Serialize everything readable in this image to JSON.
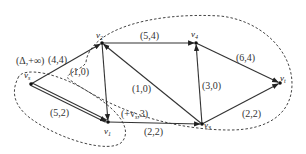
{
  "diagram": {
    "type": "flow network with cut sets",
    "nodes": [
      {
        "id": "vs",
        "label": "v",
        "sub": "s",
        "x": 31,
        "y": 84,
        "lx": 24,
        "ly": 78
      },
      {
        "id": "v2",
        "label": "v",
        "sub": "2",
        "x": 102,
        "y": 43,
        "lx": 96,
        "ly": 38
      },
      {
        "id": "v4",
        "label": "v",
        "sub": "4",
        "x": 196,
        "y": 43,
        "lx": 191,
        "ly": 37
      },
      {
        "id": "vt",
        "label": "v",
        "sub": "t",
        "x": 280,
        "y": 83,
        "lx": 280,
        "ly": 81
      },
      {
        "id": "v1",
        "label": "v",
        "sub": "1",
        "x": 108,
        "y": 122,
        "lx": 104,
        "ly": 134
      },
      {
        "id": "v3",
        "label": "v",
        "sub": "3",
        "x": 202,
        "y": 124,
        "lx": 204,
        "ly": 128
      }
    ],
    "edges": [
      {
        "from": "vs",
        "to": "v2",
        "label": "(4,4)",
        "lx": 48,
        "ly": 63
      },
      {
        "from": "vs",
        "to": "v1",
        "label": "(5,2)",
        "lx": 50,
        "ly": 116,
        "double": true
      },
      {
        "from": "v2",
        "to": "v1",
        "label": "(1,0)",
        "lx": 70,
        "ly": 75
      },
      {
        "from": "v2",
        "to": "v4",
        "label": "(5,4)",
        "lx": 140,
        "ly": 39
      },
      {
        "from": "v3",
        "to": "v2",
        "label": "(1,0)",
        "lx": 132,
        "ly": 92
      },
      {
        "from": "v1",
        "to": "v3",
        "label": "(2,2)",
        "lx": 144,
        "ly": 135
      },
      {
        "from": "v3",
        "to": "v4",
        "label": "(3,0)",
        "lx": 202,
        "ly": 89
      },
      {
        "from": "v4",
        "to": "vt",
        "label": "(6,4)",
        "lx": 236,
        "ly": 61
      },
      {
        "from": "v3",
        "to": "vt",
        "label": "(2,2)",
        "lx": 242,
        "ly": 117
      }
    ],
    "annotations": [
      {
        "id": "label-vs",
        "text": "(Δ,+∞)",
        "x": 16,
        "y": 64
      },
      {
        "id": "label-v1",
        "text": "(+v",
        "sub": "s",
        "tail": ",3)",
        "x": 121,
        "y": 117
      }
    ]
  }
}
